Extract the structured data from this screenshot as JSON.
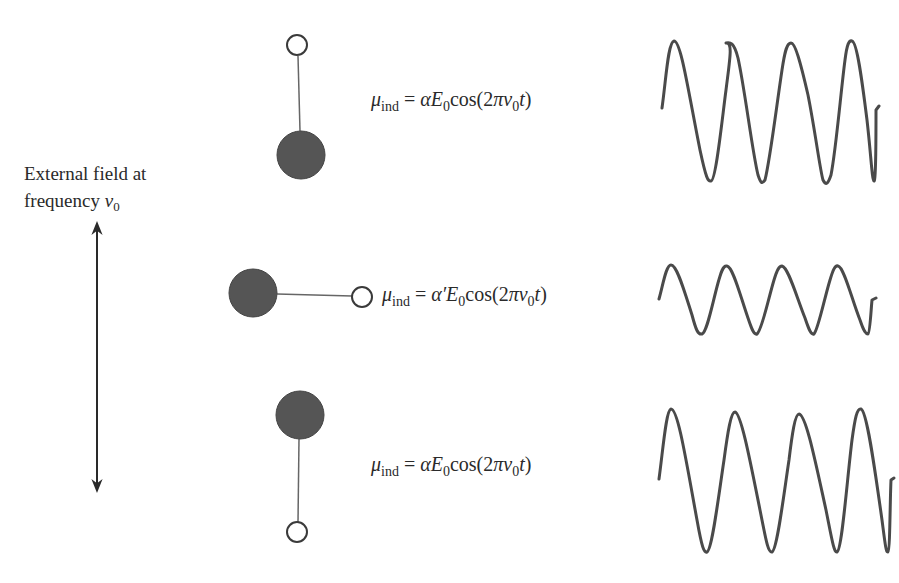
{
  "figure": {
    "external_field": {
      "label_line1": "External field at",
      "label_line2_prefix": "frequency ",
      "nu": "ν",
      "nu_sub": "0",
      "arrow": "double-headed-vertical-arrow"
    },
    "molecules": [
      {
        "orientation": "vertical, open atom on top",
        "equation": {
          "mu": "μ",
          "mu_sub": "ind",
          "eq": " = ",
          "alpha": "α",
          "E": "E",
          "E_sub": "0",
          "cos_open": "cos(2",
          "pi": "π",
          "nu": "ν",
          "nu_sub": "0",
          "t": "t",
          "close": ")"
        },
        "wave": {
          "cycles": 4,
          "amplitude": "large"
        }
      },
      {
        "orientation": "horizontal, filled atom on left",
        "equation": {
          "mu": "μ",
          "mu_sub": "ind",
          "eq": " = ",
          "alpha": "α′",
          "E": "E",
          "E_sub": "0",
          "cos_open": "cos(2",
          "pi": "π",
          "nu": "ν",
          "nu_sub": "0",
          "t": "t",
          "close": ")"
        },
        "wave": {
          "cycles": 4,
          "amplitude": "small"
        }
      },
      {
        "orientation": "vertical, filled atom on top",
        "equation": {
          "mu": "μ",
          "mu_sub": "ind",
          "eq": " = ",
          "alpha": "α",
          "E": "E",
          "E_sub": "0",
          "cos_open": "cos(2",
          "pi": "π",
          "nu": "ν",
          "nu_sub": "0",
          "t": "t",
          "close": ")"
        },
        "wave": {
          "cycles": 4,
          "amplitude": "large"
        }
      }
    ],
    "colors": {
      "ink": "#3a3a3a",
      "filled_atom": "#555555",
      "open_atom_fill": "#ffffff",
      "background": "#ffffff"
    }
  }
}
